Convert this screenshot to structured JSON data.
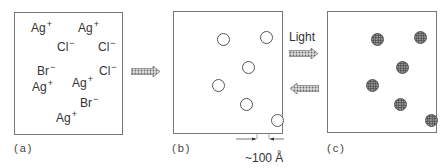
{
  "panels": {
    "a": {
      "label": "(a)",
      "ions": [
        {
          "symbol": "Ag",
          "charge": "+",
          "x": 30,
          "y": 21
        },
        {
          "symbol": "Ag",
          "charge": "+",
          "x": 77,
          "y": 21
        },
        {
          "symbol": "Cl",
          "charge": "−",
          "x": 56,
          "y": 40
        },
        {
          "symbol": "Cl",
          "charge": "−",
          "x": 97,
          "y": 40
        },
        {
          "symbol": "Br",
          "charge": "−",
          "x": 36,
          "y": 64
        },
        {
          "symbol": "Cl",
          "charge": "−",
          "x": 98,
          "y": 64
        },
        {
          "symbol": "Ag",
          "charge": "+",
          "x": 31,
          "y": 80
        },
        {
          "symbol": "Ag",
          "charge": "+",
          "x": 71,
          "y": 76
        },
        {
          "symbol": "Br",
          "charge": "−",
          "x": 79,
          "y": 96
        },
        {
          "symbol": "Ag",
          "charge": "+",
          "x": 55,
          "y": 111
        }
      ]
    },
    "b": {
      "label": "(b)",
      "particles": "empty",
      "scale_bar": "~100 Å"
    },
    "c": {
      "label": "(c)",
      "particles": "filled"
    }
  },
  "particle_positions": [
    {
      "x": 49,
      "y": 27
    },
    {
      "x": 92,
      "y": 25
    },
    {
      "x": 74,
      "y": 55
    },
    {
      "x": 44,
      "y": 73
    },
    {
      "x": 72,
      "y": 92
    },
    {
      "x": 103,
      "y": 108
    }
  ],
  "arrows": {
    "a_to_b": "right",
    "light_label": "Light",
    "b_to_c": "right",
    "c_to_b": "left"
  }
}
